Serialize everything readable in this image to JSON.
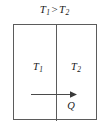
{
  "figure": {
    "title": {
      "hot_symbol": "T",
      "hot_subscript": "1",
      "relation": ">",
      "cold_symbol": "T",
      "cold_subscript": "2",
      "full_text": "T1 > T2"
    },
    "regions": [
      {
        "name": "hot-region",
        "symbol": "T",
        "subscript": "1",
        "full_text": "T1"
      },
      {
        "name": "cold-region",
        "symbol": "T",
        "subscript": "2",
        "full_text": "T2"
      }
    ],
    "heat_flow": {
      "label": "Q",
      "direction": "right",
      "arrow_icon": "right-arrow-icon"
    },
    "colors": {
      "background": "#ffffff",
      "border": "#5b5b5b",
      "text": "#1a1a1a",
      "arrow": "#4a4a4a"
    }
  }
}
